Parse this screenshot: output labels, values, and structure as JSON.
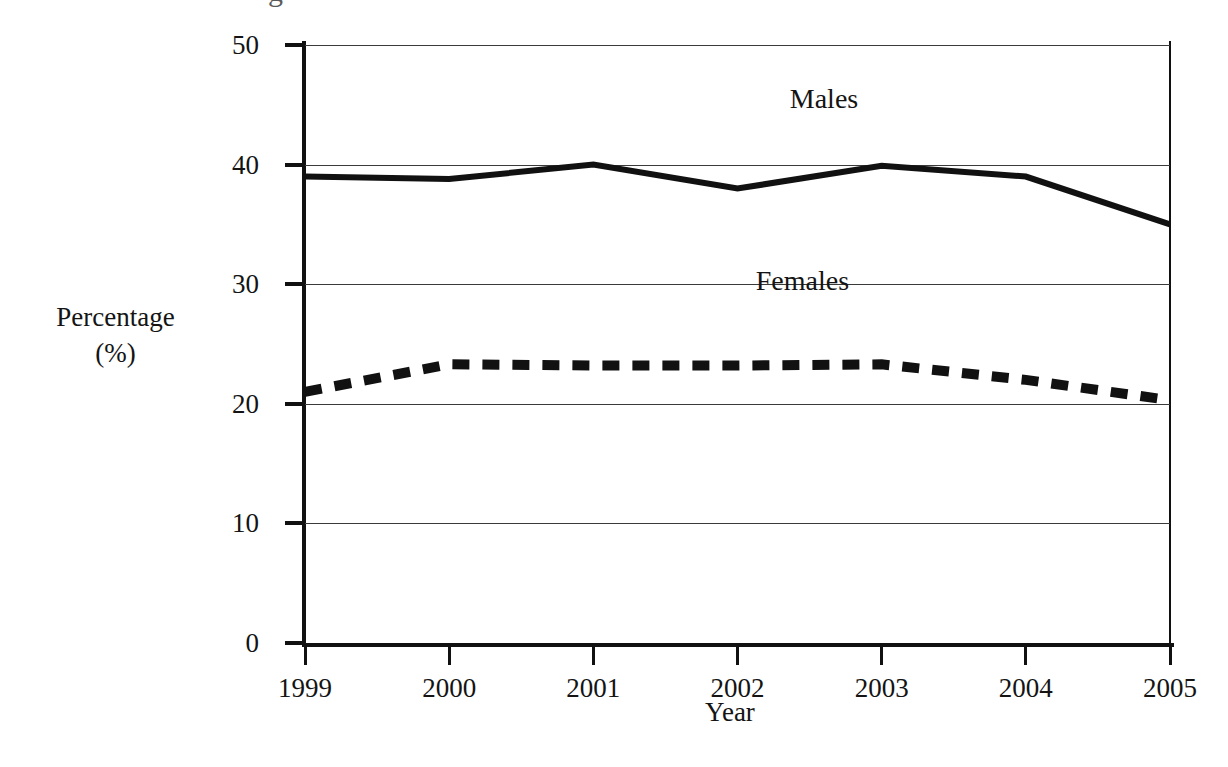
{
  "page": {
    "background_color": "#ffffff",
    "ink_color": "#111111",
    "title_fragment": "g"
  },
  "axes": {
    "y_title_line1": "Percentage",
    "y_title_line2": "(%)",
    "x_title": "Year",
    "y_ticks": [
      "0",
      "10",
      "20",
      "30",
      "40",
      "50"
    ],
    "y_tick_values": [
      0,
      10,
      20,
      30,
      40,
      50
    ],
    "x_ticks": [
      "1999",
      "2000",
      "2001",
      "2002",
      "2003",
      "2004",
      "2005"
    ]
  },
  "legend": {
    "males_label": "Males",
    "females_label": "Females"
  },
  "chart_data": {
    "type": "line",
    "title": "",
    "subtitle": "",
    "xlabel": "Year",
    "ylabel": "Percentage (%)",
    "categories": [
      "1999",
      "2000",
      "2001",
      "2002",
      "2003",
      "2004",
      "2005"
    ],
    "x": [
      1999,
      2000,
      2001,
      2002,
      2003,
      2004,
      2005
    ],
    "xlim": [
      1999,
      2005
    ],
    "ylim": [
      0,
      50
    ],
    "y_tick_step": 10,
    "grid": "horizontal",
    "legend_position": "inline-annotations",
    "series": [
      {
        "name": "Males",
        "style": "solid",
        "color": "#111111",
        "line_width": 6,
        "values": [
          39.0,
          38.8,
          40.0,
          38.0,
          39.9,
          39.0,
          35.0
        ],
        "label_x": 2002.6,
        "label_y": 45.5
      },
      {
        "name": "Females",
        "style": "dashed",
        "color": "#111111",
        "line_width": 10,
        "values": [
          21.0,
          23.3,
          23.2,
          23.2,
          23.3,
          22.0,
          20.3
        ],
        "label_x": 2002.45,
        "label_y": 30.3
      }
    ]
  }
}
